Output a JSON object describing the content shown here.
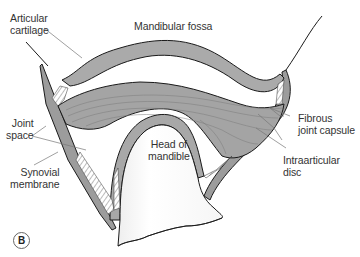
{
  "figure": {
    "panel_letter": "B",
    "colors": {
      "tissue_gray": "#a8a8a8",
      "tissue_gray_dark": "#8f8f8f",
      "outline": "#1a1a1a",
      "leader_line": "#777777",
      "label_text": "#333333",
      "bone_white": "#fafafa",
      "background": "#ffffff"
    }
  },
  "labels": {
    "articular_cartilage": {
      "line1": "Articular",
      "line2": "cartilage"
    },
    "mandibular_fossa": {
      "line1": "Mandibular fossa"
    },
    "joint_space": {
      "line1": "Joint",
      "line2": "space"
    },
    "synovial_membrane": {
      "line1": "Synovial",
      "line2": "membrane"
    },
    "head_of_mandible": {
      "line1": "Head of",
      "line2": "mandible"
    },
    "fibrous_joint_capsule": {
      "line1": "Fibrous",
      "line2": "joint capsule"
    },
    "intraarticular_disc": {
      "line1": "Intraarticular",
      "line2": "disc"
    }
  }
}
